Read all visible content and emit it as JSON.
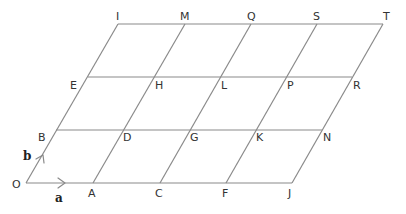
{
  "diagram": {
    "vectors": {
      "a": {
        "label": "a",
        "from": "O",
        "to": "A"
      },
      "b": {
        "label": "b",
        "from": "O",
        "to": "B"
      }
    },
    "points": [
      {
        "label": "O",
        "x": 26,
        "y": 183,
        "lx": 12,
        "ly": 188
      },
      {
        "label": "A",
        "x": 93,
        "y": 183,
        "lx": 88,
        "ly": 197
      },
      {
        "label": "C",
        "x": 160,
        "y": 183,
        "lx": 155,
        "ly": 197
      },
      {
        "label": "F",
        "x": 226,
        "y": 183,
        "lx": 222,
        "ly": 197
      },
      {
        "label": "J",
        "x": 292,
        "y": 183,
        "lx": 288,
        "ly": 197
      },
      {
        "label": "B",
        "x": 56,
        "y": 130,
        "lx": 38,
        "ly": 141
      },
      {
        "label": "D",
        "x": 122,
        "y": 130,
        "lx": 123,
        "ly": 141
      },
      {
        "label": "G",
        "x": 189,
        "y": 130,
        "lx": 190,
        "ly": 141
      },
      {
        "label": "K",
        "x": 255,
        "y": 130,
        "lx": 256,
        "ly": 141
      },
      {
        "label": "N",
        "x": 322,
        "y": 130,
        "lx": 323,
        "ly": 141
      },
      {
        "label": "E",
        "x": 88,
        "y": 77,
        "lx": 70,
        "ly": 89
      },
      {
        "label": "H",
        "x": 154,
        "y": 77,
        "lx": 155,
        "ly": 89
      },
      {
        "label": "L",
        "x": 220,
        "y": 77,
        "lx": 221,
        "ly": 89
      },
      {
        "label": "P",
        "x": 286,
        "y": 77,
        "lx": 287,
        "ly": 89
      },
      {
        "label": "R",
        "x": 352,
        "y": 77,
        "lx": 353,
        "ly": 89
      },
      {
        "label": "I",
        "x": 118,
        "y": 24,
        "lx": 116,
        "ly": 20
      },
      {
        "label": "M",
        "x": 185,
        "y": 24,
        "lx": 180,
        "ly": 20
      },
      {
        "label": "Q",
        "x": 251,
        "y": 24,
        "lx": 247,
        "ly": 20
      },
      {
        "label": "S",
        "x": 317,
        "y": 24,
        "lx": 313,
        "ly": 20
      },
      {
        "label": "T",
        "x": 383,
        "y": 24,
        "lx": 383,
        "ly": 20
      }
    ],
    "rows": [
      [
        "O",
        "A",
        "C",
        "F",
        "J"
      ],
      [
        "B",
        "D",
        "G",
        "K",
        "N"
      ],
      [
        "E",
        "H",
        "L",
        "P",
        "R"
      ],
      [
        "I",
        "M",
        "Q",
        "S",
        "T"
      ]
    ],
    "colors": {
      "line": "#8a8a8a",
      "text": "#333333",
      "background": "#ffffff"
    }
  }
}
